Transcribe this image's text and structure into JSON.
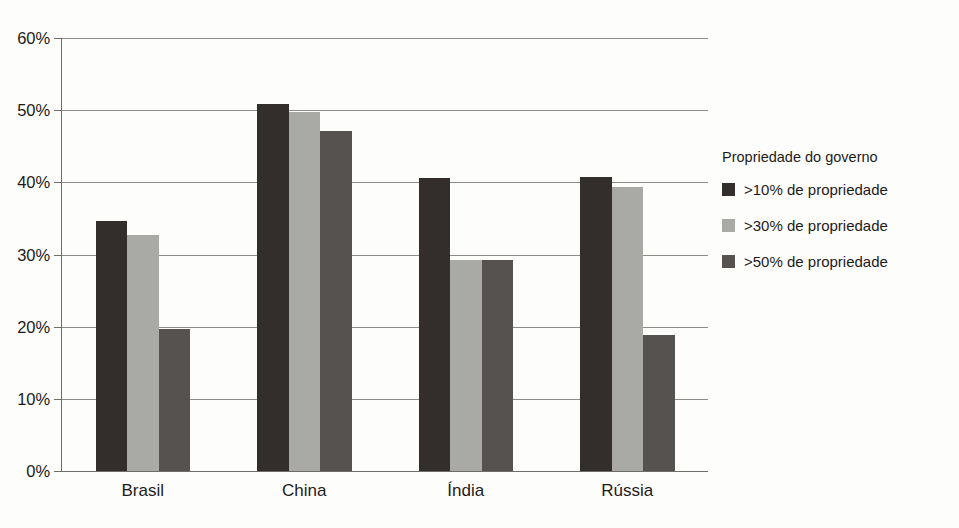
{
  "chart_data": {
    "type": "bar",
    "title": "",
    "subtitle": "",
    "xlabel": "",
    "ylabel": "",
    "ylim": [
      0,
      60
    ],
    "ytick_values": [
      0,
      10,
      20,
      30,
      40,
      50,
      60
    ],
    "ytick_labels": [
      "0%",
      "10%",
      "20%",
      "30%",
      "40%",
      "50%",
      "60%"
    ],
    "grid": true,
    "grid_axis": "y",
    "legend_position": "right",
    "legend_title": "Propriedade do governo",
    "categories": [
      "Brasil",
      "China",
      "Índia",
      "Rússia"
    ],
    "series": [
      {
        "name": ">10% de propriedade",
        "color": "#332e2c",
        "values": [
          34.7,
          50.9,
          40.6,
          40.7
        ]
      },
      {
        "name": ">30% de propriedade",
        "color": "#a9a9a6",
        "values": [
          32.7,
          49.7,
          29.2,
          39.4
        ]
      },
      {
        "name": ">50% de propriedade",
        "color": "#56524f",
        "values": [
          19.7,
          47.1,
          29.2,
          18.8
        ]
      }
    ]
  },
  "figure": {
    "background_color": "#fdfdfb",
    "axis_color": "#6f6d6a",
    "grid_color": "#8e8c88",
    "text_color": "#1d1b1a"
  }
}
